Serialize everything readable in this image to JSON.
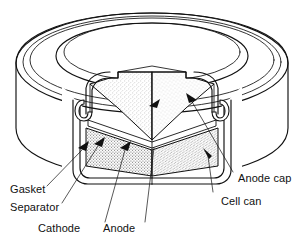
{
  "figure": {
    "background_color": "#ffffff",
    "line_color": "#111111"
  },
  "callouts": {
    "left": [
      {
        "id": "gasket",
        "label": "Gasket"
      },
      {
        "id": "separator",
        "label": "Separator"
      },
      {
        "id": "cathode",
        "label": "Cathode"
      },
      {
        "id": "anode",
        "label": "Anode"
      }
    ],
    "right": [
      {
        "id": "anode-cap",
        "label": "Anode cap"
      },
      {
        "id": "cell-can",
        "label": "Cell can"
      }
    ]
  },
  "components": {
    "anode_region": {
      "name": "Anode",
      "fill_pattern": "light-stipple"
    },
    "cathode_region": {
      "name": "Cathode",
      "fill_pattern": "dense-stipple"
    },
    "separator_layer": {
      "name": "Separator",
      "fill_pattern": "thin-line"
    },
    "gasket_seal": {
      "name": "Gasket",
      "fill_pattern": "solid-curl"
    },
    "anode_cap_shell": {
      "name": "Anode cap",
      "fill_pattern": "outline"
    },
    "cell_can_shell": {
      "name": "Cell can",
      "fill_pattern": "outline"
    }
  }
}
